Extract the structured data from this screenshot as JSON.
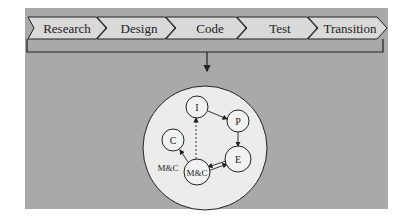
{
  "phases": [
    {
      "label": "Research"
    },
    {
      "label": "Design"
    },
    {
      "label": "Code"
    },
    {
      "label": "Test"
    },
    {
      "label": "Transition"
    }
  ],
  "cycle": {
    "nodes": [
      {
        "id": "I",
        "label": "I"
      },
      {
        "id": "P",
        "label": "P"
      },
      {
        "id": "E",
        "label": "E"
      },
      {
        "id": "MC",
        "label": "M&C"
      },
      {
        "id": "C",
        "label": "C"
      }
    ],
    "outer_label": "M&C",
    "edges": [
      {
        "from": "I",
        "to": "P",
        "style": "solid"
      },
      {
        "from": "P",
        "to": "E",
        "style": "solid"
      },
      {
        "from": "E",
        "to": "M&C",
        "style": "solid"
      },
      {
        "from": "M&C",
        "to": "E",
        "style": "solid"
      },
      {
        "from": "M&C",
        "to": "I",
        "style": "dashed"
      },
      {
        "from": "M&C",
        "to": "C",
        "style": "solid"
      }
    ]
  },
  "colors": {
    "panel": "#a9a9a9",
    "chevron": "#d9d9d9",
    "circle": "#ececec",
    "stroke": "#222222"
  }
}
